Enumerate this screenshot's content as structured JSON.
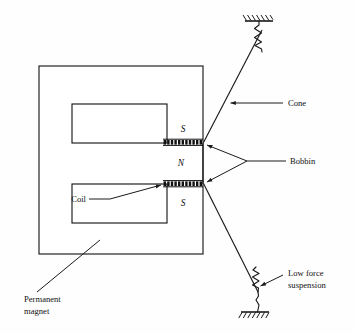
{
  "figure": {
    "background_color": "#fefefe",
    "ink_color": "#1a1a1a"
  },
  "poles": {
    "top": "S",
    "middle": "N",
    "bottom": "S"
  },
  "labels": {
    "cone": "Cone",
    "bobbin": "Bobbin",
    "coil": "Coil",
    "low_force_line1": "Low force",
    "low_force_line2": "suspension",
    "permanent_line1": "Permanent",
    "permanent_line2": "magnet"
  },
  "parts": {
    "permanent_magnet": "Permanent magnet",
    "top_coil": "upper voice coil winding",
    "bottom_coil": "lower voice coil winding",
    "top_suspension": "upper low force suspension spring",
    "bottom_suspension": "lower low force suspension spring",
    "top_fixture": "upper hatched fixed mount",
    "bottom_fixture": "lower hatched fixed mount",
    "cone_upper": "upper cone member",
    "cone_lower": "lower cone member"
  },
  "geometry": {
    "magnet_outer": {
      "x": 39,
      "y": 66,
      "w": 164,
      "h": 188
    },
    "slot_upper": {
      "x": 72,
      "y": 104,
      "w": 95,
      "h": 39
    },
    "slot_lower": {
      "x": 72,
      "y": 184,
      "w": 95,
      "h": 39
    },
    "coil_top": {
      "x": 163,
      "y": 140,
      "w": 40,
      "h": 5
    },
    "coil_bottom": {
      "x": 163,
      "y": 181,
      "w": 40,
      "h": 5
    },
    "bobbin_vertex": {
      "x": 247,
      "y": 161
    },
    "top_fixture_bar": {
      "x1": 245,
      "y1": 21,
      "x2": 273,
      "y2": 21
    },
    "bottom_fixture_bar": {
      "x1": 241,
      "y1": 312,
      "x2": 269,
      "y2": 312
    },
    "coil_turn_count": 11
  }
}
